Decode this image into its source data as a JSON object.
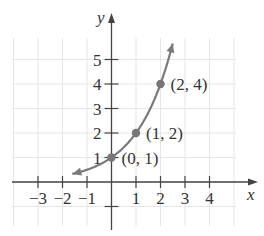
{
  "chart_data": {
    "type": "line",
    "title": "",
    "function": "y = 2^x",
    "xlabel": "x",
    "ylabel": "y",
    "xlim": [
      -4,
      5
    ],
    "ylim": [
      -1,
      6
    ],
    "grid": true,
    "x_tick_labels": [
      "−3",
      "−2",
      "−1",
      "1",
      "2",
      "3",
      "4"
    ],
    "x_ticks": [
      -3,
      -2,
      -1,
      1,
      2,
      3,
      4
    ],
    "y_tick_labels": [
      "1",
      "2",
      "3",
      "4",
      "5"
    ],
    "y_ticks": [
      1,
      2,
      3,
      4,
      5
    ],
    "series": [
      {
        "name": "curve",
        "x_range": [
          -1.6,
          2.5
        ],
        "color": "#7a7a7a"
      }
    ],
    "points": [
      {
        "x": 0,
        "y": 1,
        "label": "(0, 1)"
      },
      {
        "x": 1,
        "y": 2,
        "label": "(1, 2)"
      },
      {
        "x": 2,
        "y": 4,
        "label": "(2, 4)"
      }
    ]
  }
}
